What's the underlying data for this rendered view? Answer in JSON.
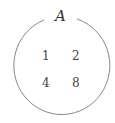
{
  "diagram": {
    "type": "set",
    "set_label": "A",
    "elements": [
      "1",
      "2",
      "4",
      "8"
    ],
    "stroke_color": "#888888"
  }
}
